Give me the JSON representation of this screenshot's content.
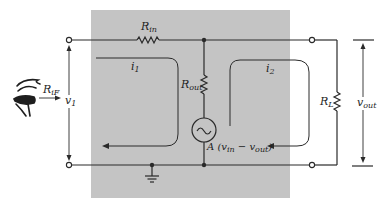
{
  "diagram": {
    "type": "circuit",
    "colors": {
      "background": "#ffffff",
      "amplifier_box": "#c4c4c4",
      "wire": "#2a2a2a"
    },
    "labels": {
      "r_in": {
        "main": "R",
        "sub": "in"
      },
      "r_out": {
        "main": "R",
        "sub": "out"
      },
      "r_l": {
        "main": "R",
        "sub": "L"
      },
      "r_if": {
        "main": "R",
        "sub": "iF"
      },
      "v1": {
        "main": "v",
        "sub": "1"
      },
      "i1": {
        "main": "i",
        "sub": "1"
      },
      "i2": {
        "main": "i",
        "sub": "2"
      },
      "v_out": {
        "main": "v",
        "sub": "out"
      },
      "source": {
        "prefix": "A (v",
        "sub1": "in",
        "mid": " − v",
        "sub2": "out",
        "suffix": ")"
      }
    },
    "components": [
      {
        "id": "R_in",
        "kind": "resistor",
        "orientation": "horizontal"
      },
      {
        "id": "R_out",
        "kind": "resistor",
        "orientation": "vertical"
      },
      {
        "id": "source",
        "kind": "ac-voltage-source"
      },
      {
        "id": "R_L",
        "kind": "resistor",
        "orientation": "vertical"
      },
      {
        "id": "ground",
        "kind": "ground"
      }
    ]
  }
}
